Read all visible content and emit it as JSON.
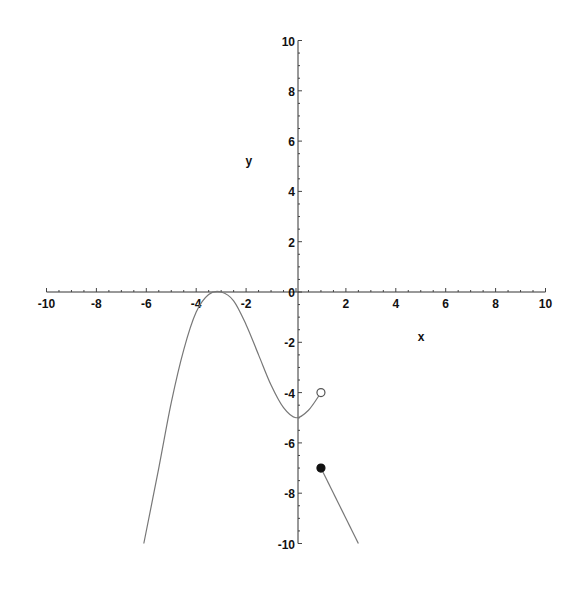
{
  "chart_data": {
    "type": "line",
    "title": "",
    "xlabel": "x",
    "ylabel": "y",
    "xlim": [
      -10,
      10
    ],
    "ylim": [
      -10,
      10
    ],
    "grid": false,
    "legend": null,
    "x_ticks": [
      -10,
      -8,
      -6,
      -4,
      -2,
      0,
      2,
      4,
      6,
      8,
      10
    ],
    "y_ticks": [
      -10,
      -8,
      -6,
      -4,
      -2,
      0,
      2,
      4,
      6,
      8,
      10
    ],
    "x_tick_labels": [
      "-10",
      "-8",
      "-6",
      "-4",
      "-2",
      "0",
      "2",
      "4",
      "6",
      "8",
      "10"
    ],
    "y_tick_labels": [
      "-10",
      "-8",
      "-6",
      "-4",
      "-2",
      "0",
      "2",
      "4",
      "6",
      "8",
      "10"
    ],
    "minor_ticks_per_unit": 2,
    "series": [
      {
        "name": "piece-1",
        "description": "curve for x < 1, local max at (-3, 0), local min near (0, -5), ends with an open circle at (1, -4)",
        "points": [
          [
            -6.1,
            -10
          ],
          [
            -5.5,
            -7
          ],
          [
            -5,
            -4.4
          ],
          [
            -4.5,
            -2.3
          ],
          [
            -4,
            -0.8
          ],
          [
            -3.5,
            -0.1
          ],
          [
            -3,
            0
          ],
          [
            -2.5,
            -0.35
          ],
          [
            -2,
            -1.3
          ],
          [
            -1.5,
            -2.5
          ],
          [
            -1,
            -3.7
          ],
          [
            -0.5,
            -4.6
          ],
          [
            0,
            -5
          ],
          [
            0.5,
            -4.7
          ],
          [
            1,
            -4
          ]
        ],
        "color": "#777777"
      },
      {
        "name": "piece-2",
        "description": "line for x >= 1, y = -2x - 5, starts with a filled dot at (1, -7)",
        "points": [
          [
            1,
            -7
          ],
          [
            2.5,
            -10
          ]
        ],
        "color": "#777777"
      }
    ],
    "markers": [
      {
        "type": "open-circle",
        "x": 1,
        "y": -4
      },
      {
        "type": "filled-circle",
        "x": 1,
        "y": -7
      }
    ],
    "annotations": [
      {
        "text": "y",
        "x": -1.9,
        "y": 5.2
      },
      {
        "text": "x",
        "x": 5,
        "y": -1.8
      }
    ]
  }
}
